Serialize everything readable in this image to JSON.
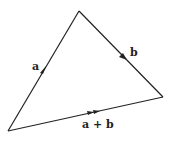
{
  "diagram": {
    "type": "vector-triangle",
    "vertices": {
      "origin": [
        8,
        131
      ],
      "apex": [
        79,
        11
      ],
      "end": [
        163,
        97
      ]
    },
    "edges": [
      {
        "from": "origin",
        "to": "apex",
        "label": "a",
        "arrows": 1
      },
      {
        "from": "apex",
        "to": "end",
        "label": "b",
        "arrows": 1
      },
      {
        "from": "origin",
        "to": "end",
        "label": "a + b",
        "arrows": 2
      }
    ],
    "labels": {
      "a": "a",
      "b": "b",
      "sum": "a + b"
    },
    "stroke_color": "#222222"
  }
}
